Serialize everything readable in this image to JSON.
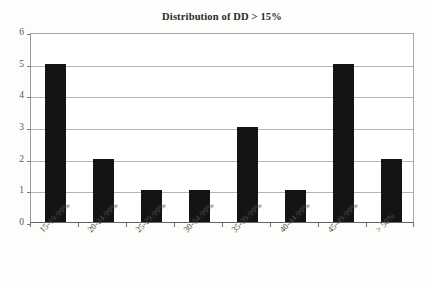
{
  "chart_data": {
    "type": "bar",
    "title": "Distribution of DD > 15%",
    "xlabel": "",
    "ylabel": "",
    "categories": [
      "15-19.99%",
      "20-24.99%",
      "25-29.99%",
      "30-34.99%",
      "35-39.99%",
      "40-44.99%",
      "45-49.99%",
      "> 50%"
    ],
    "values": [
      5,
      2,
      1,
      1,
      3,
      1,
      5,
      2
    ],
    "ylim": [
      0,
      6
    ],
    "y_ticks": [
      "0",
      "1",
      "2",
      "3",
      "4",
      "5",
      "6"
    ],
    "grid": true,
    "legend": "none",
    "bar_color": "#141414",
    "gridline_color": "#b4b4b4",
    "axis_color": "#636363",
    "title_color": "#2b2b2b",
    "tick_label_color": "#565656"
  }
}
